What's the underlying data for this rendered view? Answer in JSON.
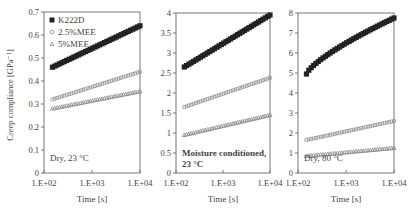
{
  "figure": {
    "ylabel": "Creep compliance [GPa⁻¹]",
    "xlabel": "Time [s]"
  },
  "chart_data": [
    {
      "type": "scatter",
      "panel_label": "Dry, 23 °C",
      "xlabel": "Time [s]",
      "ylabel": "Creep compliance [GPa⁻¹]",
      "xscale": "log",
      "xlim": [
        100,
        10000
      ],
      "xticks": [
        "1.E+02",
        "1.E+03",
        "1.E+04"
      ],
      "ylim": [
        0,
        0.7
      ],
      "yticks": [
        "0",
        "0.1",
        "0.2",
        "0.3",
        "0.4",
        "0.5",
        "0.6",
        "0.7"
      ],
      "grid": false,
      "legend": {
        "position": "upper-left",
        "entries": [
          "K222D",
          "2.5%MEE",
          "5%MEE"
        ]
      },
      "series": [
        {
          "name": "K222D",
          "marker": "filled-square",
          "start": [
            150,
            0.46
          ],
          "end": [
            10000,
            0.64
          ],
          "curve": 1.0
        },
        {
          "name": "2.5%MEE",
          "marker": "open-circle",
          "start": [
            150,
            0.32
          ],
          "end": [
            10000,
            0.44
          ],
          "curve": 1.0
        },
        {
          "name": "5%MEE",
          "marker": "open-triangle",
          "start": [
            150,
            0.28
          ],
          "end": [
            10000,
            0.355
          ],
          "curve": 1.0
        }
      ]
    },
    {
      "type": "scatter",
      "panel_label": "Moisture conditioned,\n23 °C",
      "panel_label_lines": [
        "Moisture conditioned,",
        "23 °C"
      ],
      "xlabel": "Time [s]",
      "xscale": "log",
      "xlim": [
        100,
        10000
      ],
      "xticks": [
        "1.E+02",
        "1.E+03",
        "1.E+04"
      ],
      "ylim": [
        0,
        4
      ],
      "yticks": [
        "0",
        "0.5",
        "1",
        "1.5",
        "2",
        "2.5",
        "3",
        "3.5",
        "4"
      ],
      "grid": false,
      "series": [
        {
          "name": "K222D",
          "marker": "filled-square",
          "start": [
            150,
            2.65
          ],
          "end": [
            10000,
            3.95
          ],
          "curve": 1.0
        },
        {
          "name": "2.5%MEE",
          "marker": "open-circle",
          "start": [
            150,
            1.65
          ],
          "end": [
            10000,
            2.38
          ],
          "curve": 1.0
        },
        {
          "name": "5%MEE",
          "marker": "open-triangle",
          "start": [
            150,
            0.95
          ],
          "end": [
            10000,
            1.45
          ],
          "curve": 1.0
        }
      ]
    },
    {
      "type": "scatter",
      "panel_label": "Dry, 80 °C",
      "xlabel": "Time [s]",
      "xscale": "log",
      "xlim": [
        100,
        10000
      ],
      "xticks": [
        "1.E+02",
        "1.E+03",
        "1.E+04"
      ],
      "ylim": [
        0,
        8
      ],
      "yticks": [
        "0",
        "1",
        "2",
        "3",
        "4",
        "5",
        "6",
        "7",
        "8"
      ],
      "grid": false,
      "series": [
        {
          "name": "K222D",
          "marker": "filled-square",
          "start": [
            150,
            4.95
          ],
          "end": [
            10000,
            7.75
          ],
          "curve": 0.75
        },
        {
          "name": "2.5%MEE",
          "marker": "open-circle",
          "start": [
            150,
            1.65
          ],
          "end": [
            10000,
            2.6
          ],
          "curve": 1.0
        },
        {
          "name": "5%MEE",
          "marker": "open-triangle",
          "start": [
            150,
            0.85
          ],
          "end": [
            10000,
            1.25
          ],
          "curve": 1.0
        }
      ]
    }
  ]
}
